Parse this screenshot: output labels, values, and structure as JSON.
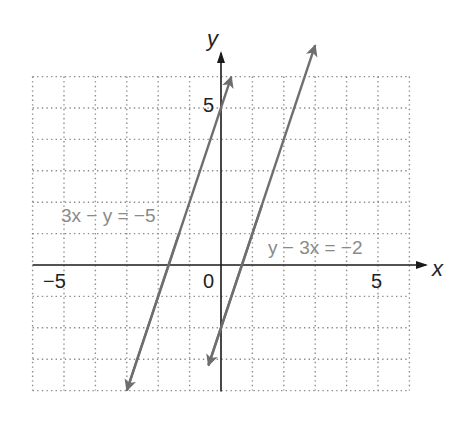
{
  "chart_data": {
    "type": "line",
    "title": "",
    "xlabel": "x",
    "ylabel": "y",
    "xlim": [
      -6,
      6
    ],
    "ylim": [
      -4,
      6
    ],
    "grid": true,
    "grid_style": "dotted",
    "grid_step": 1,
    "tick_labels": {
      "x": [
        {
          "value": -5,
          "label": "−5"
        },
        {
          "value": 0,
          "label": "0"
        },
        {
          "value": 5,
          "label": "5"
        }
      ],
      "y": [
        {
          "value": 5,
          "label": "5"
        }
      ]
    },
    "series": [
      {
        "name": "3x − y = −5",
        "equation": "y = 3x + 5",
        "slope": 3,
        "intercept": 5,
        "x_range": [
          -3.0,
          0.33
        ],
        "points": [
          [
            -3.0,
            -4.0
          ],
          [
            0.33,
            6.0
          ]
        ],
        "color": "#6e6e6e",
        "arrows": "both"
      },
      {
        "name": "y − 3x = −2",
        "equation": "y = 3x − 2",
        "slope": 3,
        "intercept": -2,
        "x_range": [
          -0.4,
          3.0
        ],
        "points": [
          [
            -0.4,
            -3.2
          ],
          [
            3.0,
            7.0
          ]
        ],
        "color": "#6e6e6e",
        "arrows": "both"
      }
    ],
    "annotations": [
      {
        "text": "3x − y = −5",
        "x": -4.3,
        "y": 1.6
      },
      {
        "text": "y − 3x = −2",
        "x": 1.5,
        "y": 0.55
      }
    ]
  },
  "labels": {
    "x_axis": "x",
    "y_axis": "y",
    "tick_neg5": "−5",
    "tick_0": "0",
    "tick_5_x": "5",
    "tick_5_y": "5",
    "eq1": "3x − y = −5",
    "eq2": "y − 3x = −2"
  },
  "colors": {
    "axis": "#1a1a1a",
    "grid": "#8c8c8c",
    "line": "#6e6e6e",
    "equation_text": "#8a8a8a"
  }
}
